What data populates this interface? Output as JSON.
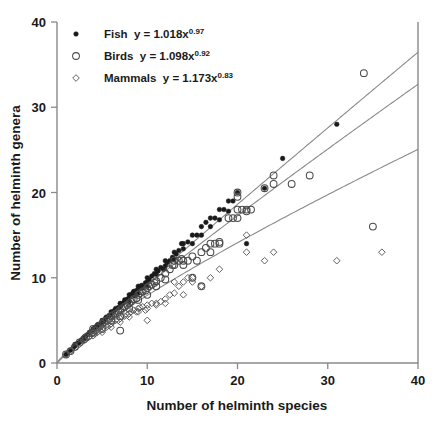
{
  "chart_data": {
    "type": "scatter",
    "title": "",
    "xlabel": "Number of helminth species",
    "ylabel": "Number of helminth genera",
    "xlim": [
      0,
      40
    ],
    "ylim": [
      0,
      40
    ],
    "xticks": [
      0,
      10,
      20,
      30,
      40
    ],
    "yticks": [
      0,
      10,
      20,
      30,
      40
    ],
    "grid": false,
    "legend_position": "top-left",
    "series": [
      {
        "name": "Fish",
        "marker": "filled-circle",
        "equation": "y = 1.018x",
        "exponent": "0.97",
        "coefficient": 1.018,
        "power": 0.97,
        "points": [
          [
            1,
            1
          ],
          [
            1.2,
            1.2
          ],
          [
            1.5,
            1.5
          ],
          [
            1.8,
            1.8
          ],
          [
            2,
            2
          ],
          [
            2,
            2.2
          ],
          [
            2.3,
            2.3
          ],
          [
            2.5,
            2.4
          ],
          [
            2.7,
            2.7
          ],
          [
            3,
            3
          ],
          [
            3,
            2.8
          ],
          [
            3.2,
            3.2
          ],
          [
            3.5,
            3.4
          ],
          [
            3.6,
            3.6
          ],
          [
            3.8,
            3.7
          ],
          [
            4,
            4
          ],
          [
            4,
            3.8
          ],
          [
            4.2,
            4.1
          ],
          [
            4.4,
            4.3
          ],
          [
            4.5,
            4.5
          ],
          [
            4.7,
            4.5
          ],
          [
            5,
            5
          ],
          [
            5,
            4.8
          ],
          [
            5.2,
            5
          ],
          [
            5.4,
            5.3
          ],
          [
            5.5,
            5.4
          ],
          [
            5.8,
            5.6
          ],
          [
            6,
            6
          ],
          [
            6,
            5.7
          ],
          [
            6.2,
            6
          ],
          [
            6.4,
            6.2
          ],
          [
            6.5,
            6.4
          ],
          [
            6.8,
            6.5
          ],
          [
            7,
            7
          ],
          [
            7,
            6.6
          ],
          [
            7.2,
            6.9
          ],
          [
            7.4,
            7.1
          ],
          [
            7.5,
            7.4
          ],
          [
            7.8,
            7.5
          ],
          [
            8,
            8
          ],
          [
            8,
            7.6
          ],
          [
            8,
            7.2
          ],
          [
            8.2,
            8
          ],
          [
            8.4,
            8.2
          ],
          [
            8.5,
            8.4
          ],
          [
            8.6,
            7.9
          ],
          [
            8.8,
            8.5
          ],
          [
            9,
            9
          ],
          [
            9,
            8.6
          ],
          [
            9,
            8.2
          ],
          [
            9.2,
            9
          ],
          [
            9.4,
            9.1
          ],
          [
            9.5,
            8.8
          ],
          [
            9.8,
            9.4
          ],
          [
            10,
            10
          ],
          [
            10,
            9.5
          ],
          [
            10,
            9
          ],
          [
            10.2,
            9.8
          ],
          [
            10.5,
            10.2
          ],
          [
            10.8,
            10.5
          ],
          [
            11,
            11
          ],
          [
            11,
            10.4
          ],
          [
            11.2,
            10.8
          ],
          [
            11.5,
            11.2
          ],
          [
            11.8,
            11
          ],
          [
            12,
            12
          ],
          [
            12,
            11.4
          ],
          [
            12.2,
            11.8
          ],
          [
            12.5,
            12
          ],
          [
            12.8,
            12.4
          ],
          [
            13,
            13
          ],
          [
            13,
            12.2
          ],
          [
            13.2,
            12.8
          ],
          [
            13.5,
            13.2
          ],
          [
            13.8,
            14
          ],
          [
            14,
            14
          ],
          [
            14,
            13.4
          ],
          [
            14.5,
            14.2
          ],
          [
            15,
            15
          ],
          [
            15,
            14
          ],
          [
            15.5,
            15
          ],
          [
            16,
            16
          ],
          [
            16,
            15
          ],
          [
            16.5,
            16.5
          ],
          [
            17,
            17
          ],
          [
            17,
            16
          ],
          [
            17.5,
            17
          ],
          [
            18,
            18
          ],
          [
            18,
            16.8
          ],
          [
            18.5,
            18
          ],
          [
            19,
            19
          ],
          [
            19,
            17.8
          ],
          [
            19.5,
            19
          ],
          [
            20,
            20
          ],
          [
            21,
            14
          ],
          [
            23,
            20.5
          ],
          [
            25,
            24
          ],
          [
            31,
            28
          ]
        ]
      },
      {
        "name": "Birds",
        "marker": "open-circle",
        "equation": "y = 1.098x",
        "exponent": "0.92",
        "coefficient": 1.098,
        "power": 0.92,
        "points": [
          [
            1,
            1
          ],
          [
            1.5,
            1.4
          ],
          [
            2,
            1.9
          ],
          [
            2.5,
            2.4
          ],
          [
            3,
            2.8
          ],
          [
            3.2,
            3
          ],
          [
            3.5,
            3.2
          ],
          [
            3.8,
            3.5
          ],
          [
            4,
            3.6
          ],
          [
            4,
            4
          ],
          [
            4.2,
            3.8
          ],
          [
            4.5,
            4.2
          ],
          [
            4.8,
            4.4
          ],
          [
            5,
            4.6
          ],
          [
            5,
            4
          ],
          [
            5.2,
            4.8
          ],
          [
            5.5,
            5
          ],
          [
            5.8,
            5.2
          ],
          [
            6,
            5.5
          ],
          [
            6,
            5
          ],
          [
            6.2,
            5.6
          ],
          [
            6.5,
            5.8
          ],
          [
            6.8,
            6
          ],
          [
            7,
            6.2
          ],
          [
            7,
            5.5
          ],
          [
            7,
            3.8
          ],
          [
            7.2,
            6.4
          ],
          [
            7.5,
            6.6
          ],
          [
            7.8,
            6.8
          ],
          [
            8,
            7
          ],
          [
            8,
            6.4
          ],
          [
            8.2,
            7.2
          ],
          [
            8.5,
            7.5
          ],
          [
            8.8,
            7.6
          ],
          [
            9,
            8
          ],
          [
            9,
            7.4
          ],
          [
            9.2,
            8.2
          ],
          [
            9.5,
            8.4
          ],
          [
            9.8,
            8.5
          ],
          [
            10,
            8.8
          ],
          [
            10,
            8
          ],
          [
            10.2,
            9
          ],
          [
            10.5,
            9.2
          ],
          [
            10.8,
            9.4
          ],
          [
            11,
            9.6
          ],
          [
            11,
            9
          ],
          [
            11.5,
            10
          ],
          [
            12,
            10.5
          ],
          [
            12,
            9.8
          ],
          [
            12.5,
            11
          ],
          [
            12.8,
            11.5
          ],
          [
            13,
            11.5
          ],
          [
            13,
            12
          ],
          [
            13.5,
            12
          ],
          [
            13.8,
            12.2
          ],
          [
            14,
            12
          ],
          [
            14,
            11.5
          ],
          [
            14.5,
            12
          ],
          [
            15,
            12.5
          ],
          [
            15,
            10
          ],
          [
            15.5,
            12
          ],
          [
            16,
            13
          ],
          [
            16,
            9
          ],
          [
            16.5,
            13.5
          ],
          [
            17,
            14
          ],
          [
            17,
            13
          ],
          [
            17.5,
            14
          ],
          [
            18,
            14.2
          ],
          [
            18,
            14
          ],
          [
            19,
            17
          ],
          [
            19.5,
            17
          ],
          [
            20,
            20
          ],
          [
            20,
            19.5
          ],
          [
            20,
            18
          ],
          [
            20,
            17
          ],
          [
            20.5,
            18
          ],
          [
            21,
            18
          ],
          [
            21,
            17.8
          ],
          [
            21.5,
            18
          ],
          [
            23,
            20.5
          ],
          [
            24,
            21
          ],
          [
            24,
            22
          ],
          [
            26,
            21
          ],
          [
            28,
            22
          ],
          [
            34,
            34
          ],
          [
            35,
            16
          ]
        ]
      },
      {
        "name": "Mammals",
        "marker": "open-diamond",
        "equation": "y = 1.173x",
        "exponent": "0.83",
        "coefficient": 1.173,
        "power": 0.83,
        "points": [
          [
            1,
            1
          ],
          [
            1.5,
            1.4
          ],
          [
            2,
            1.8
          ],
          [
            2.5,
            2.2
          ],
          [
            3,
            2.6
          ],
          [
            3.5,
            3
          ],
          [
            4,
            3.2
          ],
          [
            4,
            3.5
          ],
          [
            4.2,
            3.4
          ],
          [
            4.5,
            3.6
          ],
          [
            4.8,
            3.8
          ],
          [
            5,
            4
          ],
          [
            5,
            3.6
          ],
          [
            5.2,
            4.1
          ],
          [
            5.5,
            4.2
          ],
          [
            5.8,
            4.4
          ],
          [
            6,
            4.6
          ],
          [
            6,
            4.2
          ],
          [
            6.2,
            4.8
          ],
          [
            6.5,
            5
          ],
          [
            6.8,
            5
          ],
          [
            7,
            5.2
          ],
          [
            7,
            4.8
          ],
          [
            7.2,
            5.4
          ],
          [
            7.5,
            5.5
          ],
          [
            7.8,
            5.6
          ],
          [
            8,
            5.8
          ],
          [
            8,
            5.4
          ],
          [
            8.2,
            6
          ],
          [
            8.5,
            6.2
          ],
          [
            8.8,
            6
          ],
          [
            9,
            6.4
          ],
          [
            9,
            6
          ],
          [
            9.2,
            6.5
          ],
          [
            9.5,
            6.6
          ],
          [
            9.8,
            6.2
          ],
          [
            10,
            6.8
          ],
          [
            10,
            6.4
          ],
          [
            10,
            5
          ],
          [
            10.5,
            7
          ],
          [
            11,
            7
          ],
          [
            11,
            6.8
          ],
          [
            11.5,
            7.2
          ],
          [
            12,
            7.5
          ],
          [
            12,
            7
          ],
          [
            12.5,
            8
          ],
          [
            13,
            8.2
          ],
          [
            13,
            9.5
          ],
          [
            13.5,
            9
          ],
          [
            14,
            9.5
          ],
          [
            14,
            8
          ],
          [
            14.5,
            10
          ],
          [
            15,
            10
          ],
          [
            15,
            9.5
          ],
          [
            16,
            9
          ],
          [
            17,
            10
          ],
          [
            18,
            11
          ],
          [
            21,
            15
          ],
          [
            21,
            13
          ],
          [
            23,
            12
          ],
          [
            24,
            13
          ],
          [
            31,
            12
          ],
          [
            36,
            13
          ]
        ]
      }
    ]
  },
  "axes": {
    "x_tick_labels": [
      "0",
      "10",
      "20",
      "30",
      "40"
    ],
    "y_tick_labels": [
      "0",
      "10",
      "20",
      "30",
      "40"
    ],
    "x_title": "Number of helminth species",
    "y_title": "Number of helminth genera"
  },
  "legend": {
    "entries": [
      {
        "label": "Fish",
        "equation": "y = 1.018x",
        "exponent": "0.97",
        "marker": "filled-circle"
      },
      {
        "label": "Birds",
        "equation": "y = 1.098x",
        "exponent": "0.92",
        "marker": "open-circle"
      },
      {
        "label": "Mammals",
        "equation": "y = 1.173x",
        "exponent": "0.83",
        "marker": "open-diamond"
      }
    ]
  },
  "colors": {
    "axis": "#8a8a8a",
    "text": "#1a1a1a",
    "fish": "#1a1a1a",
    "birds": "#4a4a4a",
    "mammals": "#5a5a5a"
  }
}
